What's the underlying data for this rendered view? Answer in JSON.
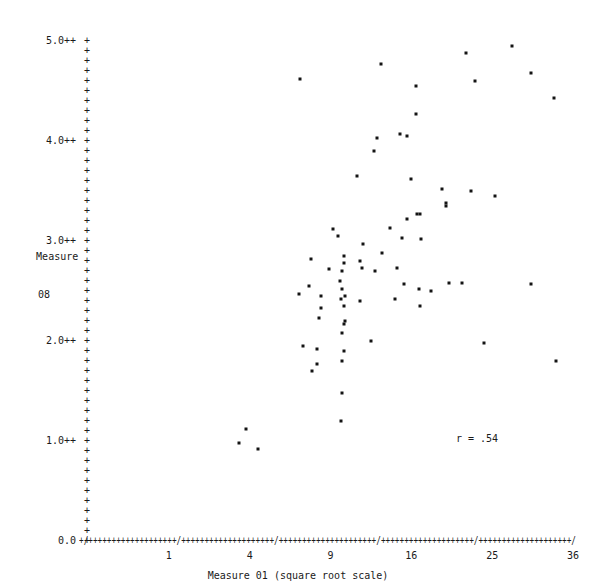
{
  "chart_data": {
    "type": "scatter",
    "title": "",
    "xlabel": "Measure 01 (square root scale)",
    "ylabel": "Measure 08",
    "ylabel_lines": [
      "Measure",
      "08"
    ],
    "annotation": "r = .54",
    "correlation": 0.54,
    "grid": false,
    "legend": null,
    "xscale": "sqrt",
    "xlim": [
      0,
      36
    ],
    "ylim": [
      0.0,
      5.0
    ],
    "xticks": [
      1,
      4,
      9,
      16,
      25,
      36
    ],
    "xtick_labels": [
      "1",
      "4",
      "9",
      "16",
      "25",
      "36"
    ],
    "yticks": [
      0.0,
      1.0,
      2.0,
      3.0,
      4.0,
      5.0
    ],
    "ytick_labels": [
      "0.0",
      "1.0++",
      "2.0++",
      "3.0++",
      "4.0++",
      "5.0++"
    ],
    "axis_style": "ascii-character-plot",
    "axis_tick_glyph": "+",
    "axis_major_glyph": "/",
    "point_glyph": "*",
    "x": [
      6.9,
      13.1,
      21.9,
      27.5,
      30.0,
      16.5,
      22.9,
      16.5,
      33.3,
      15.6,
      14.9,
      12.8,
      12.5,
      11.1,
      9.2,
      16.0,
      19.2,
      22.5,
      25.4,
      19.6,
      19.6,
      9.6,
      11.6,
      15.1,
      17.0,
      16.6,
      16.9,
      15.6,
      14.0,
      13.2,
      7.6,
      11.3,
      10.0,
      10.0,
      11.5,
      14.6,
      7.5,
      8.9,
      9.9,
      12.6,
      9.7,
      9.9,
      9.8,
      19.9,
      21.4,
      30.0,
      6.8,
      8.3,
      10.1,
      15.3,
      16.8,
      18.0,
      8.3,
      10.0,
      16.9,
      11.3,
      8.2,
      10.1,
      14.4,
      10.0,
      9.9,
      7.1,
      8.0,
      10.0,
      8.0,
      9.9,
      12.3,
      24.0,
      33.5,
      7.7,
      9.9,
      9.8,
      3.8,
      3.5,
      4.4
    ],
    "y": [
      4.62,
      4.77,
      4.88,
      4.95,
      4.68,
      4.27,
      4.6,
      4.55,
      4.43,
      4.05,
      4.07,
      4.03,
      3.9,
      3.65,
      3.12,
      3.62,
      3.52,
      3.5,
      3.45,
      3.38,
      3.35,
      3.05,
      2.97,
      3.03,
      3.02,
      3.27,
      3.27,
      3.22,
      3.13,
      2.88,
      2.82,
      2.8,
      2.85,
      2.78,
      2.73,
      2.73,
      2.55,
      2.72,
      2.7,
      2.7,
      2.6,
      2.52,
      2.42,
      2.58,
      2.58,
      2.57,
      2.47,
      2.45,
      2.45,
      2.57,
      2.52,
      2.5,
      2.33,
      2.35,
      2.35,
      2.4,
      2.23,
      2.2,
      2.42,
      2.17,
      2.08,
      1.95,
      1.92,
      1.9,
      1.77,
      1.8,
      2.0,
      1.98,
      1.8,
      1.7,
      1.48,
      1.2,
      1.12,
      0.98,
      0.92
    ],
    "n_points": 75
  },
  "axis_render": {
    "x_axis_string": "+/+++++++++++++++++++/++++++++++++++++++++/+++++++++++++++++++++/++++++++++++++++++++/++++++++++++++++++++/",
    "zero_label": "0.0"
  }
}
